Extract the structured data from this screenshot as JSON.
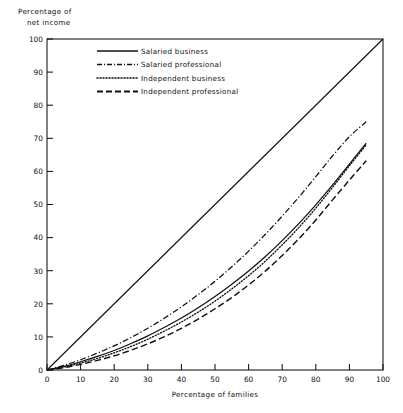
{
  "chart_data": {
    "type": "line",
    "title": "",
    "xlabel": "Percentage of families",
    "ylabel": "Percentage of net income",
    "ylabel_lines": [
      "Percentage of",
      "net income"
    ],
    "xlim": [
      0,
      100
    ],
    "ylim": [
      0,
      100
    ],
    "xticks": [
      0,
      10,
      20,
      30,
      40,
      50,
      60,
      70,
      80,
      90,
      100
    ],
    "yticks": [
      0,
      10,
      20,
      30,
      40,
      50,
      60,
      70,
      80,
      90,
      100
    ],
    "xtick_labels": [
      "0",
      "10",
      "20",
      "30",
      "40",
      "50",
      "60",
      "70",
      "80",
      "90",
      "100"
    ],
    "ytick_labels": [
      "0",
      "10",
      "20",
      "30",
      "40",
      "50",
      "60",
      "70",
      "80",
      "90",
      "100"
    ],
    "grid": false,
    "legend_position": "top-center",
    "reference_line": {
      "name": "line of equality",
      "style": "solid",
      "x": [
        0,
        100
      ],
      "y": [
        0,
        100
      ]
    },
    "series": [
      {
        "name": "Salaried business",
        "style": "solid",
        "x": [
          0,
          5,
          10,
          15,
          20,
          25,
          30,
          35,
          40,
          45,
          50,
          55,
          60,
          65,
          70,
          75,
          80,
          85,
          90,
          95
        ],
        "y": [
          0,
          1.1,
          2.5,
          4.1,
          5.9,
          8.0,
          10.3,
          12.9,
          15.7,
          18.8,
          22.2,
          25.9,
          29.9,
          34.3,
          39.1,
          44.3,
          49.9,
          55.9,
          62.2,
          68.5
        ]
      },
      {
        "name": "Salaried professional",
        "style": "dash-dot",
        "x": [
          0,
          5,
          10,
          15,
          20,
          25,
          30,
          35,
          40,
          45,
          50,
          55,
          60,
          65,
          70,
          75,
          80,
          85,
          90,
          95
        ],
        "y": [
          0,
          1.4,
          3.1,
          5.1,
          7.3,
          9.8,
          12.6,
          15.7,
          19.1,
          22.8,
          26.8,
          31.2,
          35.9,
          41.0,
          46.5,
          52.3,
          58.4,
          64.7,
          70.5,
          75.0
        ]
      },
      {
        "name": "Independent business",
        "style": "dotted",
        "x": [
          0,
          5,
          10,
          15,
          20,
          25,
          30,
          35,
          40,
          45,
          50,
          55,
          60,
          65,
          70,
          75,
          80,
          85,
          90,
          95
        ],
        "y": [
          0,
          0.9,
          2.1,
          3.5,
          5.2,
          7.1,
          9.3,
          11.8,
          14.5,
          17.5,
          20.8,
          24.5,
          28.5,
          32.9,
          37.8,
          43.1,
          48.9,
          55.2,
          61.7,
          68.0
        ]
      },
      {
        "name": "Independent professional",
        "style": "dashed",
        "x": [
          0,
          5,
          10,
          15,
          20,
          25,
          30,
          35,
          40,
          45,
          50,
          55,
          60,
          65,
          70,
          75,
          80,
          85,
          90,
          95
        ],
        "y": [
          0,
          0.7,
          1.7,
          2.9,
          4.3,
          6.0,
          7.9,
          10.1,
          12.6,
          15.4,
          18.5,
          21.9,
          25.7,
          29.9,
          34.6,
          39.7,
          45.3,
          51.4,
          57.4,
          63.2
        ]
      }
    ],
    "legend_entries": [
      {
        "label": "Salaried business",
        "style": "solid"
      },
      {
        "label": "Salaried professional",
        "style": "dash-dot"
      },
      {
        "label": "Independent business",
        "style": "dotted"
      },
      {
        "label": "Independent professional",
        "style": "dashed"
      }
    ]
  }
}
